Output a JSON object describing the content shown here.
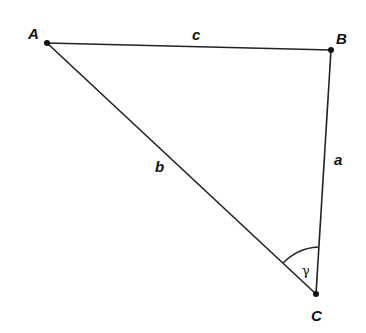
{
  "diagram": {
    "vertices": [
      {
        "id": "A",
        "label": "A",
        "x": 47,
        "y": 43
      },
      {
        "id": "B",
        "label": "B",
        "x": 331,
        "y": 50
      },
      {
        "id": "C",
        "label": "C",
        "x": 316,
        "y": 294
      }
    ],
    "sides": [
      {
        "id": "c",
        "label": "c",
        "from": "A",
        "to": "B"
      },
      {
        "id": "a",
        "label": "a",
        "from": "B",
        "to": "C"
      },
      {
        "id": "b",
        "label": "b",
        "from": "A",
        "to": "C"
      }
    ],
    "angle": {
      "vertex": "C",
      "label": "γ"
    },
    "colors": {
      "stroke": "#222222",
      "text": "#111111",
      "background": "#ffffff"
    }
  }
}
